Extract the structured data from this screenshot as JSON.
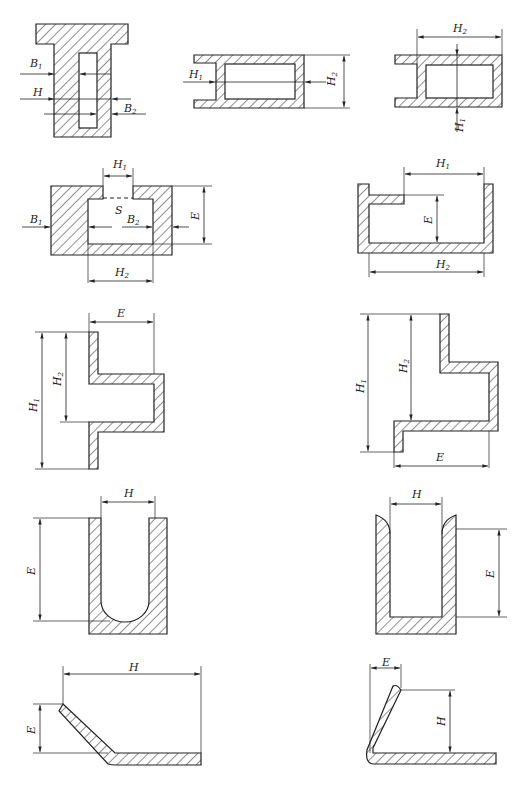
{
  "figure": {
    "hatch_color": "#222222",
    "background": "#ffffff",
    "panels": [
      {
        "id": "t-profile-slot",
        "labels": {
          "b1": "B",
          "b1_sub": "1",
          "h": "H",
          "b2": "B",
          "b2_sub": "2"
        }
      },
      {
        "id": "e-channel-horizontal-left",
        "labels": {
          "h1": "H",
          "h1_sub": "1",
          "h2": "H",
          "h2_sub": "2"
        }
      },
      {
        "id": "e-channel-horizontal-right",
        "labels": {
          "h2": "H",
          "h2_sub": "2",
          "h1": "H",
          "h1_sub": "1"
        }
      },
      {
        "id": "box-with-opening",
        "labels": {
          "h1": "H",
          "h1_sub": "1",
          "s": "S",
          "b1": "B",
          "b1_sub": "1",
          "b2": "B",
          "b2_sub": "2",
          "e": "E",
          "h2": "H",
          "h2_sub": "2"
        }
      },
      {
        "id": "channel-with-ledge",
        "labels": {
          "h1": "H",
          "h1_sub": "1",
          "e": "E",
          "h2": "H",
          "h2_sub": "2"
        }
      },
      {
        "id": "z-bend-left",
        "labels": {
          "e": "E",
          "h1": "H",
          "h1_sub": "1",
          "h2": "H",
          "h2_sub": "2"
        }
      },
      {
        "id": "z-bend-right",
        "labels": {
          "h1": "H",
          "h1_sub": "1",
          "h2": "H",
          "h2_sub": "2",
          "e": "E"
        }
      },
      {
        "id": "u-round-bottom",
        "labels": {
          "h": "H",
          "e": "E"
        }
      },
      {
        "id": "u-square-bottom",
        "labels": {
          "h": "H",
          "e": "E"
        }
      },
      {
        "id": "angled-flange",
        "labels": {
          "h": "H",
          "e": "E"
        }
      },
      {
        "id": "bent-flange",
        "labels": {
          "e": "E",
          "h": "H"
        }
      }
    ]
  }
}
